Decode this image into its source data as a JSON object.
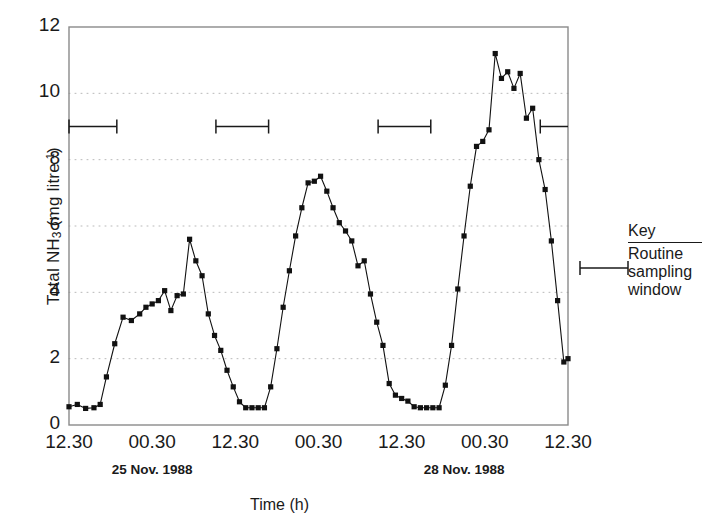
{
  "chart_data": {
    "type": "line",
    "title": "",
    "xlabel": "Time (h)",
    "ylabel": "Total NH3 (mg litre-1)",
    "ylabel_parts": {
      "prefix": "Total NH",
      "sub": "3",
      "mid": " (mg litre",
      "sup": "-1",
      "suffix": ")"
    },
    "ylim": [
      0,
      12
    ],
    "yticks": [
      0,
      2,
      4,
      6,
      8,
      10,
      12
    ],
    "xlim": [
      0,
      72
    ],
    "xticks": [
      0,
      12,
      24,
      36,
      48,
      60,
      72
    ],
    "xticklabels": [
      "12.30",
      "00.30",
      "12.30",
      "00.30",
      "12.30",
      "00.30",
      "12.30"
    ],
    "grid": "horizontal-dotted",
    "legend_position": "right-outside",
    "date_annotations": [
      {
        "label": "25 Nov. 1988",
        "x": 12
      },
      {
        "label": "28 Nov. 1988",
        "x": 57
      }
    ],
    "series": [
      {
        "name": "Total NH3",
        "marker": "filled-square",
        "color": "#111111",
        "x": [
          0.0,
          1.2,
          2.4,
          3.6,
          4.5,
          5.4,
          6.6,
          7.8,
          9.0,
          10.2,
          11.1,
          12.0,
          12.9,
          13.8,
          14.7,
          15.6,
          16.5,
          17.4,
          18.3,
          19.2,
          20.1,
          21.0,
          21.9,
          22.8,
          23.7,
          24.6,
          25.5,
          26.4,
          27.3,
          28.2,
          29.1,
          30.0,
          30.9,
          31.8,
          32.7,
          33.6,
          34.5,
          35.4,
          36.3,
          37.2,
          38.1,
          39.0,
          39.9,
          40.8,
          41.7,
          42.6,
          43.5,
          44.4,
          45.3,
          46.2,
          47.1,
          48.0,
          48.9,
          49.8,
          50.7,
          51.6,
          52.5,
          53.4,
          54.3,
          55.2,
          56.1,
          57.0,
          57.9,
          58.8,
          59.7,
          60.6,
          61.5,
          62.4,
          63.3,
          64.2,
          65.1,
          66.0,
          66.9,
          67.8,
          68.7,
          69.6,
          70.5,
          71.4,
          72.0
        ],
        "y": [
          0.55,
          0.62,
          0.5,
          0.52,
          0.62,
          1.45,
          2.45,
          3.25,
          3.15,
          3.35,
          3.55,
          3.65,
          3.75,
          4.05,
          3.45,
          3.9,
          3.95,
          5.6,
          4.95,
          4.5,
          3.35,
          2.7,
          2.25,
          1.65,
          1.15,
          0.7,
          0.52,
          0.52,
          0.52,
          0.52,
          1.15,
          2.3,
          3.55,
          4.65,
          5.7,
          6.55,
          7.3,
          7.35,
          7.5,
          7.05,
          6.55,
          6.1,
          5.85,
          5.55,
          4.8,
          4.95,
          3.95,
          3.1,
          2.4,
          1.25,
          0.9,
          0.8,
          0.72,
          0.55,
          0.52,
          0.52,
          0.52,
          0.52,
          1.2,
          2.4,
          4.1,
          5.7,
          7.2,
          8.4,
          8.55,
          8.9,
          11.2,
          10.45,
          10.65,
          10.15,
          10.6,
          9.25,
          9.55,
          8.0,
          7.1,
          5.55,
          3.75,
          1.9,
          2.0
        ]
      }
    ],
    "sampling_windows": {
      "y": 9.0,
      "label": "Routine sampling window",
      "spans": [
        {
          "x0": 0.0,
          "x1": 6.9
        },
        {
          "x0": 21.2,
          "x1": 28.8
        },
        {
          "x0": 44.6,
          "x1": 52.2
        },
        {
          "x0": 68.0,
          "x1": 72.0
        }
      ]
    }
  },
  "key": {
    "title": "Key",
    "description_lines": [
      "Routine",
      "sampling",
      "window"
    ],
    "description": "Routine sampling window",
    "marker": "i-beam-span"
  }
}
